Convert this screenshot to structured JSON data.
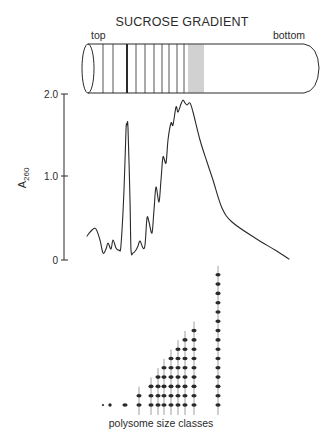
{
  "title": "SUCROSE GRADIENT",
  "tube": {
    "top_label": "top",
    "bottom_label": "bottom",
    "bands_x": [
      103,
      113,
      136,
      145,
      154,
      162,
      169,
      177,
      184
    ],
    "thick_band_x": 127,
    "dense_bands_x": [
      189,
      191,
      193,
      195,
      197,
      199,
      201,
      203
    ]
  },
  "chart_data": {
    "type": "line",
    "title": "",
    "xlabel": "",
    "ylabel": "A260",
    "ylabel_main": "A",
    "ylabel_sub": "260",
    "yticks": [
      "2.0",
      "1.0",
      "0"
    ],
    "ylim": [
      0,
      2.0
    ],
    "grid": false,
    "series": [
      {
        "name": "A260 absorbance profile (top to bottom of gradient)",
        "points_px": [
          [
            87,
            236
          ],
          [
            92,
            230
          ],
          [
            96,
            229
          ],
          [
            100,
            240
          ],
          [
            103,
            253
          ],
          [
            106,
            249
          ],
          [
            108,
            243
          ],
          [
            111,
            249
          ],
          [
            113,
            240
          ],
          [
            116,
            248
          ],
          [
            119,
            250
          ],
          [
            121,
            245
          ],
          [
            124,
            190
          ],
          [
            126,
            130
          ],
          [
            127,
            125
          ],
          [
            128,
            128
          ],
          [
            130,
            200
          ],
          [
            131,
            250
          ],
          [
            133,
            253
          ],
          [
            136,
            250
          ],
          [
            138,
            246
          ],
          [
            140,
            241
          ],
          [
            143,
            248
          ],
          [
            145,
            245
          ],
          [
            147,
            218
          ],
          [
            149,
            222
          ],
          [
            152,
            233
          ],
          [
            154,
            210
          ],
          [
            156,
            187
          ],
          [
            159,
            202
          ],
          [
            161,
            180
          ],
          [
            163,
            157
          ],
          [
            166,
            163
          ],
          [
            168,
            140
          ],
          [
            171,
            123
          ],
          [
            173,
            125
          ],
          [
            176,
            107
          ],
          [
            178,
            112
          ],
          [
            181,
            104
          ],
          [
            183,
            100
          ],
          [
            185,
            103
          ],
          [
            187,
            105
          ],
          [
            190,
            103
          ],
          [
            193,
            112
          ],
          [
            200,
            140
          ],
          [
            207,
            162
          ],
          [
            213,
            180
          ],
          [
            222,
            208
          ],
          [
            232,
            222
          ],
          [
            255,
            238
          ],
          [
            275,
            250
          ],
          [
            289,
            259
          ]
        ],
        "approx_values": {
          "monosome_peak": 1.6,
          "max_polysome_peak": 1.95
        }
      }
    ]
  },
  "polysomes": {
    "label": "polysome size classes",
    "classes": [
      {
        "x": 103,
        "ribosomes": 0,
        "kind": "small-subunit"
      },
      {
        "x": 110,
        "ribosomes": 0,
        "kind": "large-subunit"
      },
      {
        "x": 125,
        "ribosomes": 1,
        "kind": "monosome"
      },
      {
        "x": 139,
        "ribosomes": 2
      },
      {
        "x": 151,
        "ribosomes": 3
      },
      {
        "x": 158,
        "ribosomes": 4
      },
      {
        "x": 164,
        "ribosomes": 5
      },
      {
        "x": 171,
        "ribosomes": 6
      },
      {
        "x": 178,
        "ribosomes": 7
      },
      {
        "x": 185,
        "ribosomes": 8
      },
      {
        "x": 194,
        "ribosomes": 9
      },
      {
        "x": 218,
        "ribosomes": 15
      }
    ]
  },
  "colors": {
    "ink": "#2a2a2a",
    "background": "#ffffff"
  }
}
